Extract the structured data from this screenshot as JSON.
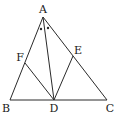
{
  "diagram": {
    "type": "geometry",
    "points": {
      "A": {
        "label": "A",
        "x": 43,
        "y": 17,
        "lx": 43,
        "ly": 13
      },
      "B": {
        "label": "B",
        "x": 10,
        "y": 100,
        "lx": 6,
        "ly": 112
      },
      "C": {
        "label": "C",
        "x": 107,
        "y": 100,
        "lx": 110,
        "ly": 112
      },
      "D": {
        "label": "D",
        "x": 54,
        "y": 100,
        "lx": 54,
        "ly": 112
      },
      "E": {
        "label": "E",
        "x": 73,
        "y": 56,
        "lx": 78,
        "ly": 54
      },
      "F": {
        "label": "F",
        "x": 25,
        "y": 63,
        "lx": 20,
        "ly": 61
      }
    },
    "segments": [
      [
        "A",
        "B"
      ],
      [
        "A",
        "C"
      ],
      [
        "B",
        "C"
      ],
      [
        "A",
        "D"
      ],
      [
        "D",
        "E"
      ],
      [
        "D",
        "F"
      ]
    ],
    "angle_marks": [
      {
        "x": 41,
        "y": 29,
        "meaning": "angle BAD"
      },
      {
        "x": 48,
        "y": 28,
        "meaning": "angle DAC"
      }
    ],
    "colors": {
      "stroke": "#2a2a2a",
      "text": "#1a1a1a",
      "background": "#ffffff"
    }
  }
}
